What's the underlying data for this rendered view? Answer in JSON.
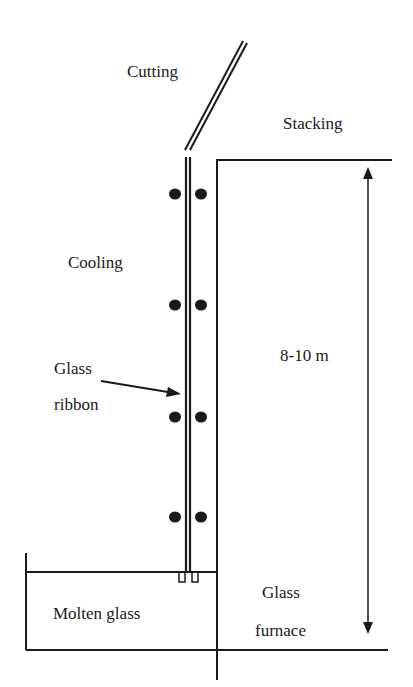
{
  "diagram": {
    "type": "glass-drawing-process",
    "labels": {
      "cutting": "Cutting",
      "stacking": "Stacking",
      "cooling": "Cooling",
      "glass_ribbon_line1": "Glass",
      "glass_ribbon_line2": "ribbon",
      "height": "8-10 m",
      "glass_furnace_line1": "Glass",
      "glass_furnace_line2": "furnace",
      "molten_glass": "Molten glass"
    },
    "roller_pairs": 4,
    "colors": {
      "ink": "#1a1a1a",
      "background": "#ffffff"
    }
  }
}
